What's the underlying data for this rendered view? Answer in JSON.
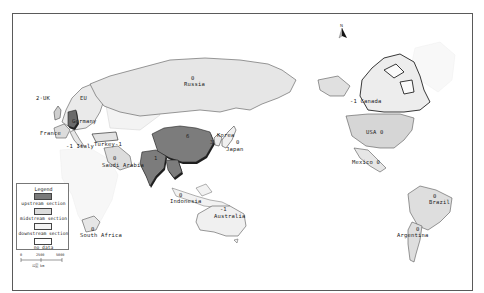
{
  "map": {
    "type": "choropleth world map (Pacific-centered)",
    "north_arrow": {
      "label": "N"
    },
    "colors": {
      "upstream": "#7a7a7a",
      "midstream": "#dcdcdc",
      "downstream": "#f4f4f4",
      "no_data": "#ffffff",
      "border": "#444444",
      "shadow": "#222222"
    },
    "countries": [
      {
        "name": "UK",
        "value": "2"
      },
      {
        "name": "EU",
        "value": ""
      },
      {
        "name": "Germany",
        "value": ""
      },
      {
        "name": "France",
        "value": ""
      },
      {
        "name": "Italy",
        "value": "-1"
      },
      {
        "name": "Turkey",
        "value": "-1"
      },
      {
        "name": "Saudi Arabia",
        "value": "0"
      },
      {
        "name": "Russia",
        "value": "0"
      },
      {
        "name": "China",
        "value": "6"
      },
      {
        "name": "India",
        "value": "1"
      },
      {
        "name": "Korea",
        "value": "3"
      },
      {
        "name": "Japan",
        "value": "0"
      },
      {
        "name": "Indonesia",
        "value": "0"
      },
      {
        "name": "Australia",
        "value": "-1"
      },
      {
        "name": "South Africa",
        "value": "0"
      },
      {
        "name": "Canada",
        "value": "-1"
      },
      {
        "name": "USA",
        "value": "0"
      },
      {
        "name": "Mexico",
        "value": "0"
      },
      {
        "name": "Brazil",
        "value": "0"
      },
      {
        "name": "Argentina",
        "value": "0"
      }
    ]
  },
  "legend": {
    "title": "Legend",
    "items": [
      {
        "label": "upstream section",
        "class": "upstream"
      },
      {
        "label": "midstream section",
        "class": "midstream"
      },
      {
        "label": "downstream section",
        "class": "downstream"
      },
      {
        "label": "no data",
        "class": "no_data"
      }
    ]
  },
  "scale_bar": {
    "ticks": [
      "0",
      "2500",
      "5000"
    ],
    "unit": "公里 km"
  }
}
